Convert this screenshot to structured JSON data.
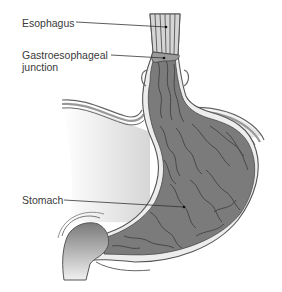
{
  "figure": {
    "labels": [
      {
        "id": "esophagus",
        "text": "Esophagus"
      },
      {
        "id": "ge-junction",
        "text": "Gastroesophageal\njunction"
      },
      {
        "id": "stomach",
        "text": "Stomach"
      }
    ]
  },
  "labels": {
    "esophagus": "Esophagus",
    "ge_junction_line1": "Gastroesophageal",
    "ge_junction_line2": "junction",
    "stomach": "Stomach"
  },
  "colors": {
    "tissue_dark": "#6e6e6e",
    "tissue_mid": "#8a8a8a",
    "wall_light": "#e8e8e8",
    "outline": "#555555",
    "background_shade": "#d9d9d9"
  }
}
